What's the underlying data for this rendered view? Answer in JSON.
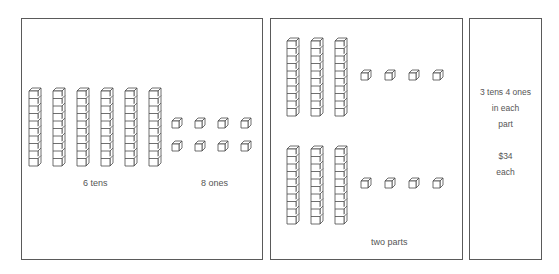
{
  "panels": [
    {
      "id": "whole",
      "tens_count": 6,
      "ones_count": 8,
      "label_tens": "6 tens",
      "label_ones": "8 ones"
    },
    {
      "id": "split",
      "parts": 2,
      "tens_per_part": 3,
      "ones_per_part": 4,
      "label": "two parts"
    },
    {
      "id": "result",
      "line1": "3 tens 4 ones",
      "line2": "in each",
      "line3": "part",
      "line4": "$34",
      "line5": "each"
    }
  ],
  "colors": {
    "stroke": "#4a4a4a",
    "border": "#5a5a5a",
    "text": "#555555"
  }
}
